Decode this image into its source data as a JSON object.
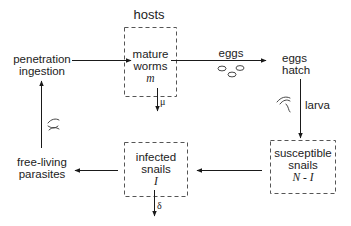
{
  "diagram": {
    "title": "hosts",
    "nodes": {
      "mature_worms": {
        "line1": "mature",
        "line2": "worms",
        "variable": "m"
      },
      "eggs_hatch": {
        "line1": "eggs",
        "line2": "hatch"
      },
      "susceptible_snails": {
        "line1": "susceptible",
        "line2": "snails",
        "variable": "N - I"
      },
      "infected_snails": {
        "line1": "infected",
        "line2": "snails",
        "variable": "I"
      },
      "free_living_parasites": {
        "line1": "free-living",
        "line2": "parasites"
      },
      "penetration_ingestion": {
        "line1": "penetration",
        "line2": "ingestion"
      }
    },
    "edge_labels": {
      "eggs": "eggs",
      "larva": "larva",
      "mu": "μ",
      "delta": "δ"
    },
    "colors": {
      "line": "#1a1a1a",
      "dashed_box": "#555555",
      "background": "#ffffff"
    }
  }
}
